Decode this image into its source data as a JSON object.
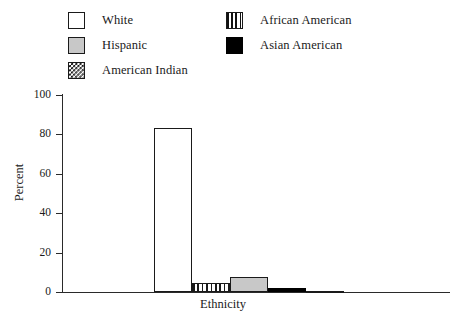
{
  "legend": {
    "entries": [
      {
        "label": "White",
        "pattern": "solid-white",
        "column": "left",
        "row": 0
      },
      {
        "label": "Hispanic",
        "pattern": "solid-gray",
        "column": "left",
        "row": 1
      },
      {
        "label": "American Indian",
        "pattern": "checkerboard",
        "column": "left",
        "row": 2
      },
      {
        "label": "African American",
        "pattern": "vertical-stripe",
        "column": "right",
        "row": 0
      },
      {
        "label": "Asian American",
        "pattern": "solid-black",
        "column": "right",
        "row": 1
      }
    ]
  },
  "axes": {
    "y_ticks": [
      "0",
      "20",
      "40",
      "60",
      "80",
      "100"
    ],
    "y_title": "Percent",
    "x_title": "Ethnicity"
  },
  "colors": {
    "axis": "#2a2a2a",
    "outline": "#1a1a1a",
    "gray_fill": "#c8c8c8",
    "black_fill": "#000000",
    "white_fill": "#ffffff"
  },
  "chart_data": {
    "type": "bar",
    "title": "",
    "xlabel": "Ethnicity",
    "ylabel": "Percent",
    "ylim": [
      0,
      100
    ],
    "yticks": [
      0,
      20,
      40,
      60,
      80,
      100
    ],
    "grid": false,
    "legend_position": "top",
    "categories": [
      "White",
      "African American",
      "Hispanic",
      "Asian American",
      "American Indian"
    ],
    "values": [
      83,
      4.5,
      7.5,
      2,
      0.5
    ],
    "bars": [
      {
        "category": "White",
        "value": 83,
        "pattern": "solid-white",
        "x_px": 154,
        "width_px": 38
      },
      {
        "category": "African American",
        "value": 4.5,
        "pattern": "vertical-stripe",
        "x_px": 192,
        "width_px": 38
      },
      {
        "category": "Hispanic",
        "value": 7.5,
        "pattern": "solid-gray",
        "x_px": 230,
        "width_px": 38
      },
      {
        "category": "Asian American",
        "value": 2,
        "pattern": "solid-black",
        "x_px": 268,
        "width_px": 38
      },
      {
        "category": "American Indian",
        "value": 0.5,
        "pattern": "checkerboard",
        "x_px": 306,
        "width_px": 38
      }
    ]
  }
}
